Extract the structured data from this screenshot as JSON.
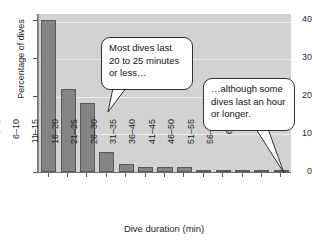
{
  "chart_data": {
    "type": "bar",
    "title": "",
    "xlabel": "Dive duration (min)",
    "ylabel": "Percentage of dives",
    "categories": [
      "0–5",
      "6–10",
      "11–15",
      "16–20",
      "21–25",
      "26–30",
      "31–35",
      "36–40",
      "41–45",
      "46–50",
      "51–55",
      "56–60",
      "60+"
    ],
    "values": [
      40.3,
      22.2,
      18.4,
      5.4,
      2.2,
      1.3,
      1.3,
      1.3,
      0.5,
      0.4,
      0.4,
      0.4,
      0.4
    ],
    "ylim": [
      0,
      42
    ],
    "yticks": [
      0,
      10,
      20,
      30,
      40
    ],
    "ytick_labels": [
      "0",
      "10",
      "20",
      "30",
      "40"
    ],
    "grid": "horizontal",
    "legend": "none",
    "bar_color": "#848484",
    "bar_edge_color": "#595959",
    "plot_background": "#d2d2d2",
    "gridline_color": "#ededed",
    "figure_background": "#ffffff",
    "annotations": [
      {
        "id": "callout-dives",
        "text": "Most dives last\n20 to 25 minutes\nor less…",
        "points_to_category": "11–15"
      },
      {
        "id": "callout-hour",
        "text": "…although some\ndives last an hour\nor longer.",
        "points_to_category": "60+"
      }
    ]
  }
}
